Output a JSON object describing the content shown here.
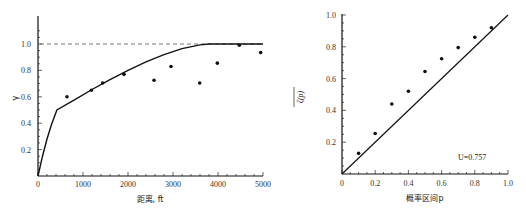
{
  "chart_data": [
    {
      "type": "scatter",
      "title": "",
      "xlabel": "距离, ft",
      "ylabel": "γ",
      "xlim": [
        0,
        5000
      ],
      "ylim": [
        0,
        1.15
      ],
      "xticks": [
        "0",
        "1000",
        "2000",
        "3000",
        "4000",
        "5000"
      ],
      "yticks": [
        "0.2",
        "0.4",
        "0.6",
        "0.8",
        "1.0"
      ],
      "grid": false,
      "reference_line": {
        "y": 1.0,
        "style": "dashed"
      },
      "series": [
        {
          "name": "observed",
          "kind": "points",
          "x": [
            644,
            1185,
            1437,
            1911,
            2578,
            2956,
            3593,
            3985,
            4474,
            4948
          ],
          "y": [
            0.6,
            0.65,
            0.705,
            0.77,
            0.725,
            0.83,
            0.705,
            0.855,
            0.99,
            0.935
          ]
        },
        {
          "name": "model",
          "kind": "line",
          "x": [
            0,
            100,
            200,
            300,
            420,
            800,
            1200,
            1600,
            2000,
            2400,
            2800,
            3200,
            3600,
            3800,
            4000,
            5000
          ],
          "y": [
            0,
            0.15,
            0.28,
            0.39,
            0.5,
            0.575,
            0.655,
            0.73,
            0.8,
            0.865,
            0.92,
            0.965,
            0.993,
            1.0,
            1.0,
            1.0
          ]
        }
      ]
    },
    {
      "type": "scatter",
      "title": "",
      "xlabel": "概率区间p",
      "ylabel": "ζ(p)",
      "xlim": [
        0,
        1.0
      ],
      "ylim": [
        0,
        1.0
      ],
      "xticks": [
        "0",
        "0.2",
        "0.4",
        "0.6",
        "0.8",
        "1.0"
      ],
      "yticks": [
        "0.2",
        "0.4",
        "0.6",
        "0.8",
        "1.0"
      ],
      "grid": false,
      "annotation": "U=0.757",
      "series": [
        {
          "name": "observed",
          "kind": "points",
          "x": [
            0.1,
            0.2,
            0.3,
            0.4,
            0.5,
            0.6,
            0.7,
            0.8,
            0.9
          ],
          "y": [
            0.13,
            0.255,
            0.44,
            0.52,
            0.645,
            0.725,
            0.795,
            0.86,
            0.92
          ]
        },
        {
          "name": "1:1 line",
          "kind": "line",
          "x": [
            0,
            1.0
          ],
          "y": [
            0,
            1.0
          ]
        }
      ]
    }
  ],
  "left": {
    "xlabel": "距离, ft",
    "ylabel": "γ",
    "yticks": [
      "0.2",
      "0.4",
      "0.6",
      "0.8",
      "1.0"
    ],
    "xticks": [
      "0",
      "1000",
      "2000",
      "3000",
      "4000",
      "5000"
    ]
  },
  "right": {
    "xlabel": "概率区间p",
    "ylabel": "ζ(p)",
    "yticks": [
      "0.2",
      "0.4",
      "0.6",
      "0.8",
      "1.0"
    ],
    "xticks": [
      "0",
      "0.2",
      "0.4",
      "0.6",
      "0.8",
      "1.0"
    ],
    "annotation": "U=0.757"
  }
}
